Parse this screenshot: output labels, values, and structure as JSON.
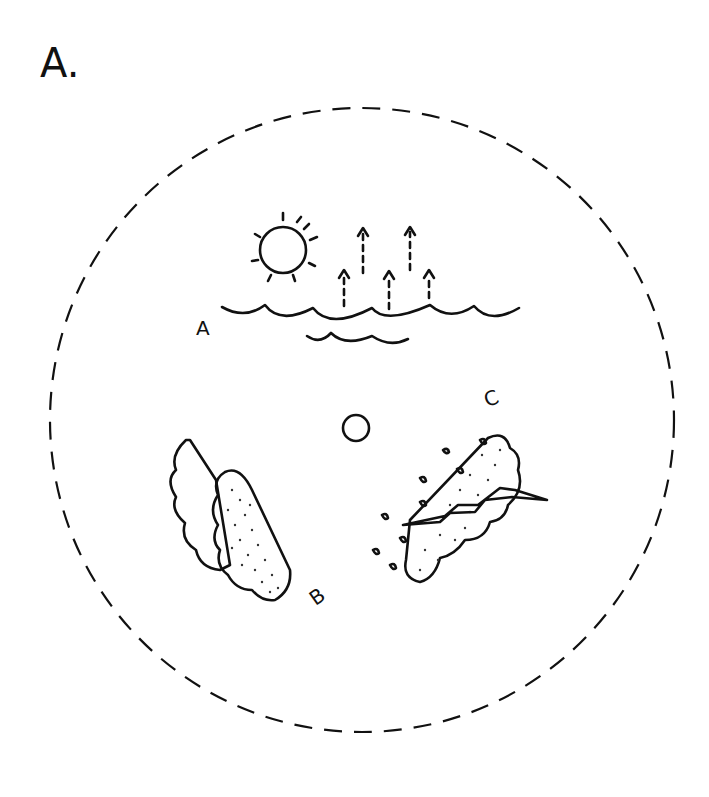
{
  "figure": {
    "panel_label": "A.",
    "stages": [
      {
        "letter": "A",
        "description": "Sun heating ocean; water evaporating upward"
      },
      {
        "letter": "B",
        "description": "Cumulus cloud formation"
      },
      {
        "letter": "C",
        "description": "Storm cloud with lightning and rain"
      }
    ],
    "boundary": "dashed-circle",
    "colors": {
      "ink": "#111111",
      "background": "#ffffff"
    }
  }
}
